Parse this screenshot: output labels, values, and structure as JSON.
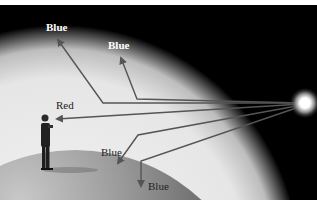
{
  "diagram": {
    "labels": [
      {
        "id": "ray1",
        "text": "Blue"
      },
      {
        "id": "ray2",
        "text": "Blue"
      },
      {
        "id": "ray3",
        "text": "Red"
      },
      {
        "id": "ray4",
        "text": "Blue"
      },
      {
        "id": "ray5",
        "text": "Blue"
      }
    ],
    "colors": {
      "sky": "#000000",
      "atmosphere": "#ececec",
      "planet": "#8c8c8c",
      "ray": "#555555",
      "sun": "#ffffff"
    }
  }
}
